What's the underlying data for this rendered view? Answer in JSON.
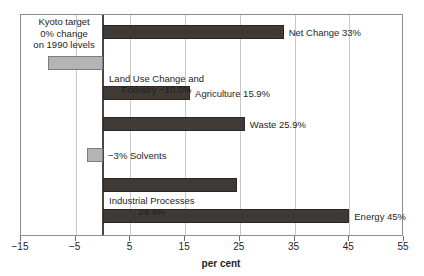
{
  "chart_data": {
    "type": "bar",
    "orientation": "horizontal",
    "title": "",
    "xlabel": "per cent",
    "ylabel": "",
    "xlim": [
      -15,
      55
    ],
    "xticks": [
      -15,
      -5,
      5,
      15,
      25,
      35,
      45,
      55
    ],
    "xticklabels": [
      "−15",
      "−5",
      "5",
      "15",
      "25",
      "35",
      "45",
      "55"
    ],
    "gridlines": [
      -5,
      5,
      15,
      25,
      35,
      45
    ],
    "grid": true,
    "zero_line": 0,
    "legend": "none",
    "categories": [
      "Net Change",
      "Land Use Change and Forestry",
      "Agriculture",
      "Waste",
      "Solvents",
      "Industrial Processes",
      "Energy"
    ],
    "values": [
      33,
      -10.0,
      15.9,
      25.9,
      -3,
      24.4,
      45
    ],
    "bars": [
      {
        "name": "Net Change",
        "value": 33,
        "value_text": "33%",
        "label": "Net Change 33%",
        "label_lines": [
          "Net Change 33%"
        ],
        "color": "#3f3a36",
        "style": "dark",
        "label_side": "right"
      },
      {
        "name": "Land Use Change and Forestry",
        "value": -10.0,
        "value_text": "−10.0%",
        "label": "Land Use Change and Forestry −10.0%",
        "label_lines": [
          "Land Use Change and",
          "Forestry −10.0%"
        ],
        "color": "#b4b4b4",
        "style": "grey",
        "label_side": "right"
      },
      {
        "name": "Agriculture",
        "value": 15.9,
        "value_text": "15.9%",
        "label": "Agriculture 15.9%",
        "label_lines": [
          "Agriculture 15.9%"
        ],
        "color": "#3f3a36",
        "style": "dark",
        "label_side": "right"
      },
      {
        "name": "Waste",
        "value": 25.9,
        "value_text": "25.9%",
        "label": "Waste 25.9%",
        "label_lines": [
          "Waste 25.9%"
        ],
        "color": "#3f3a36",
        "style": "dark",
        "label_side": "right"
      },
      {
        "name": "Solvents",
        "value": -3,
        "value_text": "−3%",
        "label": "−3% Solvents",
        "label_lines": [
          "−3% Solvents"
        ],
        "color": "#b4b4b4",
        "style": "grey",
        "label_side": "right"
      },
      {
        "name": "Industrial Processes",
        "value": 24.4,
        "value_text": "24.4%",
        "label": "Industrial Processes 24.4%",
        "label_lines": [
          "Industrial Processes",
          "24.4%"
        ],
        "color": "#3f3a36",
        "style": "dark",
        "label_side": "right"
      },
      {
        "name": "Energy",
        "value": 45,
        "value_text": "45%",
        "label": "Energy 45%",
        "label_lines": [
          "Energy 45%"
        ],
        "color": "#3f3a36",
        "style": "dark",
        "label_side": "right"
      }
    ],
    "annotations": [
      {
        "name": "kyoto-target-note",
        "lines": [
          "Kyoto target",
          "0% change",
          "on 1990 levels"
        ],
        "text": "Kyoto target 0% change on 1990 levels"
      }
    ]
  },
  "colors": {
    "bar_dark": "#3f3a36",
    "bar_grey": "#b4b4b4",
    "grid": "#c9c9c9",
    "frame": "#8d8d8d",
    "zero_axis": "#4a4542",
    "text": "#231f1c",
    "background": "#ffffff"
  }
}
